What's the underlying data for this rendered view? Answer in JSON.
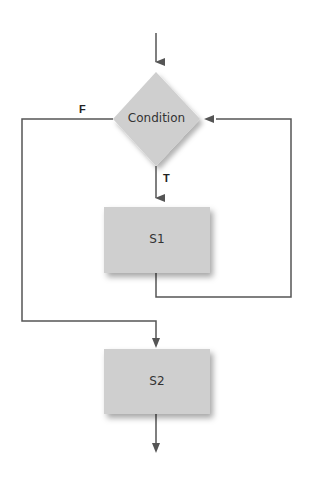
{
  "diagram": {
    "type": "flowchart",
    "title": "",
    "nodes": [
      {
        "id": "condition",
        "shape": "diamond",
        "label": "Condition"
      },
      {
        "id": "s1",
        "shape": "rectangle",
        "label": "S1"
      },
      {
        "id": "s2",
        "shape": "rectangle",
        "label": "S2"
      }
    ],
    "edges": [
      {
        "from": "start",
        "to": "condition",
        "label": ""
      },
      {
        "from": "condition",
        "to": "s1",
        "label": "T"
      },
      {
        "from": "s1",
        "to": "condition",
        "label": ""
      },
      {
        "from": "condition",
        "to": "s2",
        "label": "F"
      },
      {
        "from": "s2",
        "to": "end",
        "label": ""
      }
    ],
    "colors": {
      "node_fill": "#cfcfcf",
      "line": "#555555",
      "background": "#ffffff"
    }
  }
}
